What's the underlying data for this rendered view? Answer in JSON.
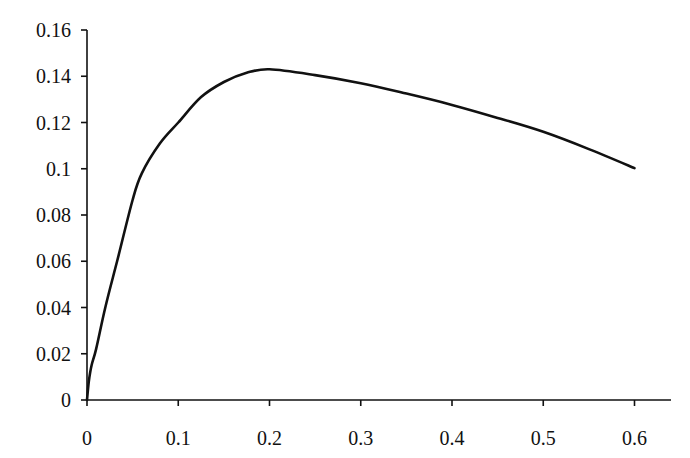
{
  "chart_data": {
    "type": "line",
    "title": "",
    "xlabel": "",
    "ylabel": "",
    "xlim": [
      0,
      0.64
    ],
    "ylim": [
      0,
      0.16
    ],
    "grid": false,
    "legend": null,
    "x_ticks": [
      "0",
      "0.1",
      "0.2",
      "0.3",
      "0.4",
      "0.5",
      "0.6"
    ],
    "y_ticks": [
      "0",
      "0.02",
      "0.04",
      "0.06",
      "0.08",
      "0.1",
      "0.12",
      "0.14",
      "0.16"
    ],
    "series": [
      {
        "name": "curve",
        "color": "#111111",
        "x": [
          0,
          0.002,
          0.005,
          0.01,
          0.02,
          0.033,
          0.05,
          0.06,
          0.08,
          0.1,
          0.125,
          0.15,
          0.175,
          0.2,
          0.25,
          0.3,
          0.35,
          0.4,
          0.45,
          0.5,
          0.55,
          0.6
        ],
        "y": [
          0,
          0.008,
          0.015,
          0.022,
          0.04,
          0.06,
          0.0865,
          0.098,
          0.111,
          0.12,
          0.131,
          0.1375,
          0.1415,
          0.143,
          0.1405,
          0.137,
          0.1325,
          0.1276,
          0.122,
          0.116,
          0.1085,
          0.1003
        ]
      }
    ]
  }
}
